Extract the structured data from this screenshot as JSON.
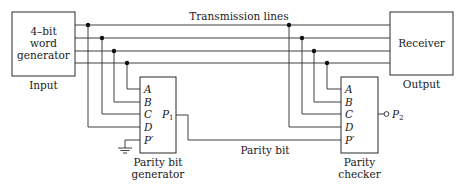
{
  "diagram": {
    "type": "block-diagram",
    "title_label": "Transmission lines",
    "word_generator": {
      "lines": [
        "4–bit",
        "word",
        "generator"
      ],
      "caption": "Input"
    },
    "receiver": {
      "label": "Receiver",
      "caption": "Output"
    },
    "parity_generator": {
      "pins": [
        "A",
        "B",
        "C",
        "D",
        "P′"
      ],
      "output_pin": "P",
      "output_sub": "1",
      "caption_lines": [
        "Parity bit",
        "generator"
      ]
    },
    "parity_checker": {
      "pins": [
        "A",
        "B",
        "C",
        "D",
        "P′"
      ],
      "output_pin": "P",
      "output_sub": "2",
      "caption_lines": [
        "Parity",
        "checker"
      ]
    },
    "parity_bit_label": "Parity bit",
    "connections": [
      {
        "from": "word-generator",
        "to": "receiver",
        "via": "transmission-line-1"
      },
      {
        "from": "word-generator",
        "to": "receiver",
        "via": "transmission-line-2"
      },
      {
        "from": "word-generator",
        "to": "receiver",
        "via": "transmission-line-3"
      },
      {
        "from": "word-generator",
        "to": "receiver",
        "via": "transmission-line-4"
      },
      {
        "from": "transmission-line-1",
        "to": "parity-generator.D"
      },
      {
        "from": "transmission-line-2",
        "to": "parity-generator.C"
      },
      {
        "from": "transmission-line-3",
        "to": "parity-generator.B"
      },
      {
        "from": "transmission-line-4",
        "to": "parity-generator.A"
      },
      {
        "from": "ground",
        "to": "parity-generator.P′"
      },
      {
        "from": "parity-generator.P1",
        "to": "parity-checker.P′",
        "label": "Parity bit"
      },
      {
        "from": "transmission-line-1",
        "to": "parity-checker.D"
      },
      {
        "from": "transmission-line-2",
        "to": "parity-checker.C"
      },
      {
        "from": "transmission-line-3",
        "to": "parity-checker.B"
      },
      {
        "from": "transmission-line-4",
        "to": "parity-checker.A"
      },
      {
        "from": "parity-checker",
        "to": "P2-output"
      }
    ]
  }
}
